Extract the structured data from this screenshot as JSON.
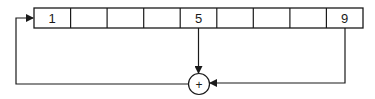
{
  "diagram": {
    "type": "shift-register-feedback",
    "register": {
      "cells": [
        "1",
        "",
        "",
        "",
        "5",
        "",
        "",
        "",
        "9"
      ]
    },
    "adder": {
      "symbol": "+"
    },
    "taps": [
      "5",
      "9"
    ],
    "feedback_target": "1",
    "colors": {
      "line": "#1a1a1a",
      "background": "#ffffff"
    }
  }
}
